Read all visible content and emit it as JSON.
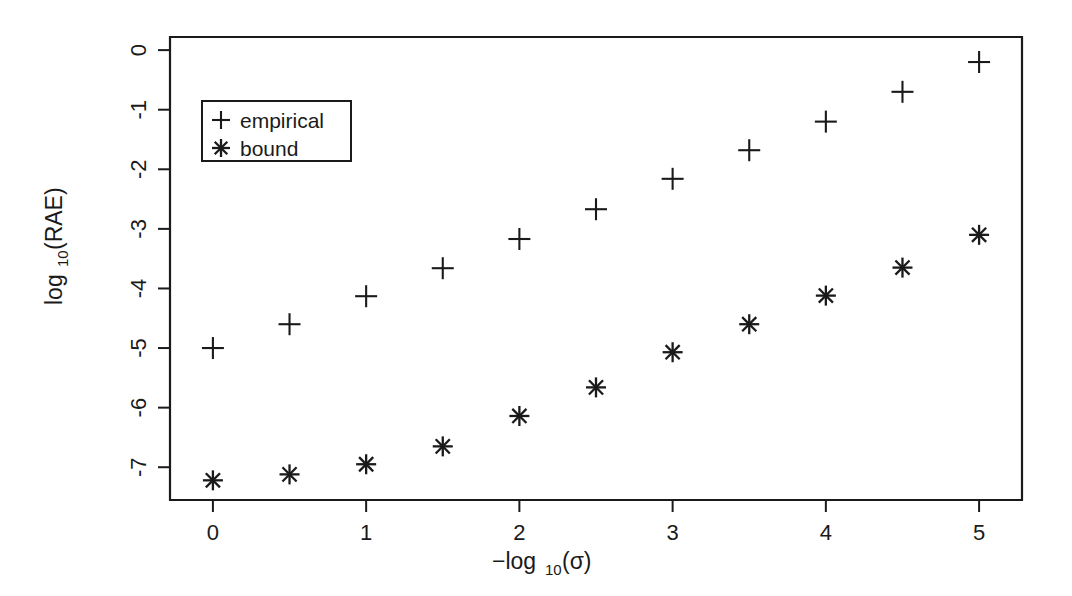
{
  "chart_data": {
    "type": "scatter",
    "title": "",
    "subtitle": "",
    "xlabel": "−log₁₀(σ)",
    "ylabel": "log₁₀(RAE)",
    "xlabel_parts": {
      "prefix": "−log",
      "sub": "10",
      "suffix": "(σ)"
    },
    "ylabel_parts": {
      "prefix": "log",
      "sub": "10",
      "suffix": "(RAE)"
    },
    "x": [
      0,
      0.5,
      1,
      1.5,
      2,
      2.5,
      3,
      3.5,
      4,
      4.5,
      5
    ],
    "xlim": [
      -0.28,
      5.28
    ],
    "ylim": [
      -7.55,
      0.22
    ],
    "xticks": [
      0,
      1,
      2,
      3,
      4,
      5
    ],
    "xtick_labels": [
      "0",
      "1",
      "2",
      "3",
      "4",
      "5"
    ],
    "yticks": [
      0,
      -1,
      -2,
      -3,
      -4,
      -5,
      -6,
      -7
    ],
    "ytick_labels": [
      "0",
      "-1",
      "-2",
      "-3",
      "-4",
      "-5",
      "-6",
      "-7"
    ],
    "grid": false,
    "legend_position": "top-left",
    "series": [
      {
        "name": "empirical",
        "marker": "plus",
        "color": "#1a1a1a",
        "values": [
          -5.0,
          -4.6,
          -4.13,
          -3.66,
          -3.17,
          -2.67,
          -2.16,
          -1.68,
          -1.2,
          -0.7,
          -0.2
        ]
      },
      {
        "name": "bound",
        "marker": "asterisk",
        "color": "#1a1a1a",
        "values": [
          -7.22,
          -7.12,
          -6.95,
          -6.65,
          -6.14,
          -5.66,
          -5.07,
          -4.6,
          -4.12,
          -3.65,
          -3.1
        ]
      }
    ]
  },
  "legend": {
    "entries": [
      {
        "symbol": "+",
        "label": "empirical"
      },
      {
        "symbol": "✳",
        "label": "bound"
      }
    ]
  },
  "colors": {
    "ink": "#1a1a1a",
    "background": "#ffffff"
  }
}
